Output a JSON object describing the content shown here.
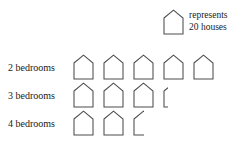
{
  "top_caption": "",
  "legend": {
    "icon_name": "house-icon",
    "line1": "represents",
    "line2": "20 houses",
    "unit_value": 20,
    "unit_noun": "houses"
  },
  "rows": [
    {
      "label": "2 bedrooms",
      "full_icons": 5,
      "partial_fraction": 0,
      "value": 100
    },
    {
      "label": "3 bedrooms",
      "full_icons": 3,
      "partial_fraction": 0.25,
      "value": 65
    },
    {
      "label": "4 bedrooms",
      "full_icons": 2,
      "partial_fraction": 0.5,
      "value": 50
    }
  ],
  "chart_data": {
    "type": "bar",
    "chart_style": "pictograph",
    "title": "",
    "xlabel": "",
    "ylabel": "",
    "categories": [
      "2 bedrooms",
      "3 bedrooms",
      "4 bedrooms"
    ],
    "values": [
      100,
      65,
      50
    ],
    "icon_counts": [
      5,
      3.25,
      2.5
    ],
    "unit_per_icon": 20,
    "unit_label": "20 houses",
    "legend": "represents 20 houses",
    "grid": false,
    "legend_position": "top-right",
    "xlim": [
      0,
      110
    ]
  },
  "style": {
    "stroke": "#4d4d4d",
    "fill": "#ffffff",
    "text": "#1a1a1a"
  }
}
